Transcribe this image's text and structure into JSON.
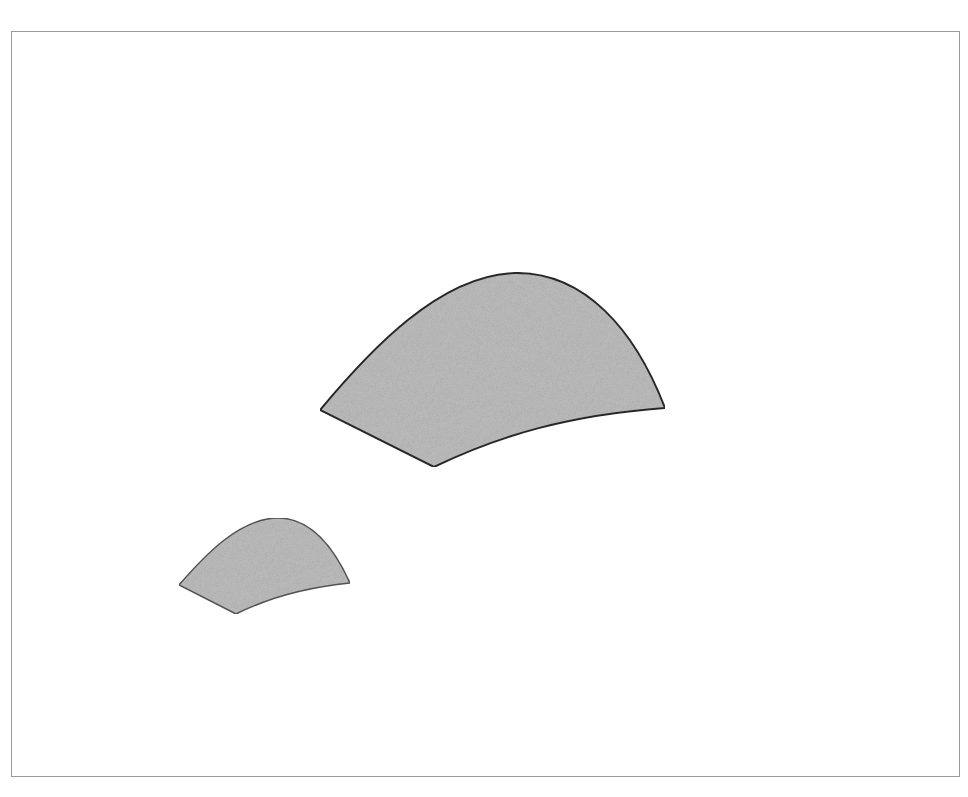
{
  "diagram": {
    "frame": {
      "x": 11,
      "y": 31,
      "width": 949,
      "height": 746,
      "stroke": "#9a9a9a"
    },
    "fill_color": "#bdbdbd",
    "shapes": [
      {
        "name": "large-curved-patch",
        "stroke": "#2a2a2a",
        "stroke_width": 2,
        "path": "M 320 410 C 370 350, 440 275, 515 273 C 585 272, 635 330, 665 408 C 570 415, 500 435, 434 467 Z"
      },
      {
        "name": "small-curved-patch",
        "stroke": "#555555",
        "stroke_width": 1.5,
        "path": "M 179 585 C 205 555, 240 518, 278 518 C 312 518, 335 550, 350 583 C 310 587, 270 597, 236 614 Z"
      }
    ]
  }
}
